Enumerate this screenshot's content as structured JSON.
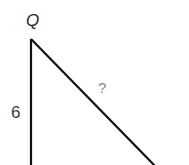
{
  "diagram": {
    "type": "right-triangle",
    "vertex_label": "Q",
    "side_label": "6",
    "hypotenuse_label": "?",
    "colors": {
      "stroke": "#111111",
      "vertex_text": "#2a2a2a",
      "side_text": "#3a3a3a",
      "unknown_text": "#8a8a8a"
    }
  }
}
